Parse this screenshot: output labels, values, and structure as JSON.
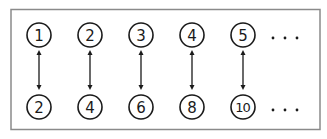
{
  "diagram": {
    "top_row": [
      "1",
      "2",
      "3",
      "4",
      "5"
    ],
    "bottom_row": [
      "2",
      "4",
      "6",
      "8",
      "10"
    ],
    "continuation": "...",
    "relation": "double-headed arrows connect n to 2n",
    "colors": {
      "stroke": "#1a1a1a",
      "frame": "#8a8a8a",
      "background": "#ffffff"
    }
  }
}
